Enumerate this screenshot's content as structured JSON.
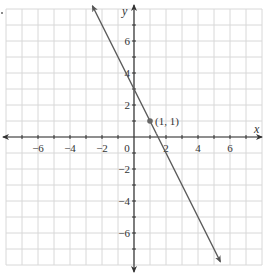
{
  "chart_data": {
    "type": "line",
    "title": "",
    "xlabel": "x",
    "ylabel": "y",
    "xlim": [
      -8,
      8
    ],
    "ylim": [
      -8,
      8
    ],
    "grid": true,
    "x_ticks": [
      -6,
      -4,
      -2,
      0,
      2,
      4,
      6
    ],
    "y_ticks": [
      -6,
      -4,
      -2,
      2,
      4,
      6
    ],
    "x_tick_labels": [
      "−6",
      "−4",
      "−2",
      "0",
      "2",
      "4",
      "6"
    ],
    "y_tick_labels": [
      "−6",
      "−4",
      "−2",
      "2",
      "4",
      "6"
    ],
    "series": [
      {
        "name": "line",
        "equation": "y = -2x + 3",
        "x": [
          -2.6,
          5.4
        ],
        "y": [
          8.2,
          -7.8
        ]
      }
    ],
    "points": [
      {
        "x": 1,
        "y": 1,
        "label": "(1, 1)"
      }
    ],
    "colors": {
      "line": "#5a5a5a",
      "grid": "#d8d8d8",
      "axis": "#333333"
    }
  }
}
